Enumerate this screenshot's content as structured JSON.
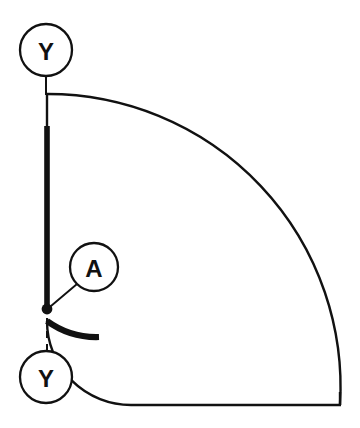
{
  "drawing": {
    "type": "engineering-gdt-quarter-annulus",
    "background_color": "#ffffff",
    "line_color": "#111111",
    "canvas": {
      "width": 360,
      "height": 428
    },
    "geometry": {
      "center_x": 47,
      "center_y": 405,
      "outer_radius": 293,
      "inner_radius": 84,
      "outer_arc_start": "47,94",
      "outer_arc_end": "340,405",
      "inner_arc_start": "47,308",
      "inner_arc_end": "131,405",
      "bottom_edge_from_x": 131,
      "bottom_edge_to_x": 340,
      "bottom_edge_y": 405,
      "left_edge_x": 47,
      "left_edge_from_y": 94,
      "left_edge_to_y": 308
    },
    "thin_stroke_width": 2.4,
    "thick_stroke_width": 5.6,
    "emphasis": {
      "vertical_feature": {
        "label": "thick-vertical-edge",
        "x": 47,
        "from_y": 126,
        "to_y": 308
      },
      "arc_feature": {
        "label": "thick-inner-arc-segment",
        "start_angle_deg": 0,
        "end_angle_deg": 38
      }
    },
    "datum_point": {
      "label": "A",
      "x": 47,
      "y": 308,
      "dot_radius": 5
    }
  },
  "balloons": [
    {
      "id": "balloon-y-top",
      "label": "Y",
      "cx": 46,
      "cy": 50,
      "r": 26,
      "leader_from": "46,76",
      "leader_to": "46,94",
      "leader_style": "solid"
    },
    {
      "id": "balloon-a",
      "label": "A",
      "cx": 94,
      "cy": 267,
      "r": 24,
      "leader_from": "77,284",
      "leader_to": "50,306",
      "leader_style": "solid"
    },
    {
      "id": "balloon-y-bottom",
      "label": "Y",
      "cx": 46,
      "cy": 377,
      "r": 26,
      "leader_from": "47,351",
      "leader_to": "47,314",
      "leader_style": "dashed"
    }
  ]
}
